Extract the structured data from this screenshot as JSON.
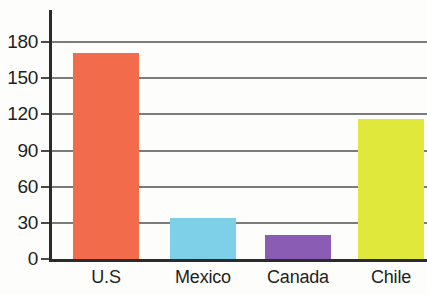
{
  "chart_data": {
    "type": "bar",
    "title": "",
    "subtitle": "",
    "xlabel": "",
    "ylabel": "",
    "categories": [
      "U.S",
      "Mexico",
      "Canada",
      "Chile"
    ],
    "values": [
      171,
      34,
      20,
      116
    ],
    "series": [
      {
        "name": "",
        "values": [
          171,
          34,
          20,
          116
        ]
      }
    ],
    "colors": [
      "#F26C4B",
      "#7ED0E8",
      "#8A5CB4",
      "#E0E83C"
    ],
    "ylim": [
      0,
      190
    ],
    "y_ticks": [
      0,
      30,
      60,
      90,
      120,
      150,
      180
    ],
    "y_tick_labels": [
      "0",
      "30",
      "60",
      "90",
      "120",
      "150",
      "180"
    ],
    "grid": true,
    "grid_axis": "y",
    "legend": false,
    "legend_position": "none",
    "annotations": []
  },
  "axis": {
    "y_labels": [
      "180",
      "150",
      "120",
      "90",
      "60",
      "30",
      "0"
    ],
    "x_labels": [
      "U.S",
      "Mexico",
      "Canada",
      "Chile"
    ]
  },
  "bars": [
    {
      "label": "U.S",
      "value": 171,
      "color": "#F26C4B"
    },
    {
      "label": "Mexico",
      "value": 34,
      "color": "#7ED0E8"
    },
    {
      "label": "Canada",
      "value": 20,
      "color": "#8A5CB4"
    },
    {
      "label": "Chile",
      "value": 116,
      "color": "#E0E83C"
    }
  ],
  "style": {
    "axis_color": "#2b2b2b",
    "grid_color": "#7b7b7b",
    "text_color": "#231f20",
    "background": "#fdfdfc"
  }
}
